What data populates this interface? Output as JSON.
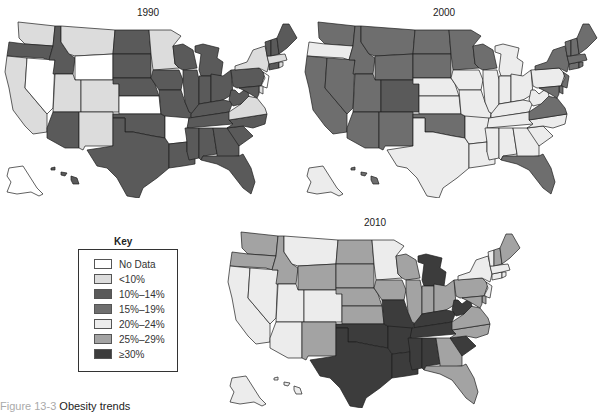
{
  "figure": {
    "caption_label": "Figure 13-3",
    "caption_title": "Obesity trends"
  },
  "key": {
    "title": "Key",
    "categories": [
      {
        "id": "nd",
        "label": "No Data",
        "color": "#ffffff"
      },
      {
        "id": "lt10",
        "label": "<10%",
        "color": "#dcdcdc"
      },
      {
        "id": "c10",
        "label": "10%–14%",
        "color": "#5a5a5a"
      },
      {
        "id": "c15",
        "label": "15%–19%",
        "color": "#6e6e6e"
      },
      {
        "id": "c20",
        "label": "20%–24%",
        "color": "#ececec"
      },
      {
        "id": "c25",
        "label": "25%–29%",
        "color": "#a3a3a3"
      },
      {
        "id": "c30",
        "label": "≥30%",
        "color": "#3c3c3c"
      }
    ]
  },
  "chart_data": [
    {
      "type": "choropleth",
      "title": "1990",
      "legend_position": "separate key box, lower left",
      "values": {
        "WA": "lt10",
        "OR": "c10",
        "CA": "lt10",
        "NV": "nd",
        "ID": "c10",
        "MT": "lt10",
        "WY": "nd",
        "UT": "lt10",
        "CO": "lt10",
        "AZ": "c10",
        "NM": "lt10",
        "ND": "c10",
        "SD": "c10",
        "NE": "c10",
        "KS": "nd",
        "OK": "c10",
        "TX": "c10",
        "MN": "lt10",
        "IA": "c10",
        "MO": "c10",
        "AR": "nd",
        "LA": "c10",
        "WI": "c10",
        "IL": "c10",
        "MI": "c10",
        "IN": "c10",
        "OH": "c10",
        "KY": "c10",
        "TN": "c10",
        "MS": "c10",
        "AL": "c10",
        "GA": "c10",
        "FL": "c10",
        "SC": "c10",
        "NC": "c10",
        "VA": "lt10",
        "WV": "c10",
        "PA": "c10",
        "NY": "lt10",
        "NJ": "nd",
        "DE": "lt10",
        "MD": "c10",
        "CT": "c10",
        "RI": "lt10",
        "MA": "lt10",
        "VT": "c10",
        "NH": "c10",
        "ME": "c10",
        "AK": "nd",
        "HI": "c10"
      }
    },
    {
      "type": "choropleth",
      "title": "2000",
      "values": {
        "WA": "c15",
        "OR": "c20",
        "CA": "c15",
        "NV": "c15",
        "ID": "c15",
        "MT": "c15",
        "WY": "c15",
        "UT": "c15",
        "CO": "c10",
        "AZ": "c15",
        "NM": "c15",
        "ND": "c15",
        "SD": "c15",
        "NE": "c20",
        "KS": "c20",
        "OK": "c15",
        "TX": "c20",
        "MN": "c15",
        "IA": "c20",
        "MO": "c20",
        "AR": "c20",
        "LA": "c20",
        "WI": "c15",
        "IL": "c20",
        "MI": "c20",
        "IN": "c20",
        "OH": "c20",
        "KY": "c20",
        "TN": "c20",
        "MS": "c20",
        "AL": "c20",
        "GA": "c20",
        "FL": "c15",
        "SC": "c20",
        "NC": "c20",
        "VA": "c15",
        "WV": "c20",
        "PA": "c20",
        "NY": "c15",
        "NJ": "c15",
        "DE": "c15",
        "MD": "c15",
        "CT": "c15",
        "RI": "c15",
        "MA": "c15",
        "VT": "c15",
        "NH": "c15",
        "ME": "c15",
        "AK": "c20",
        "HI": "c15"
      }
    },
    {
      "type": "choropleth",
      "title": "2010",
      "values": {
        "WA": "c25",
        "OR": "c25",
        "CA": "c20",
        "NV": "c20",
        "ID": "c25",
        "MT": "c20",
        "WY": "c25",
        "UT": "c20",
        "CO": "c20",
        "AZ": "c20",
        "NM": "c25",
        "ND": "c25",
        "SD": "c25",
        "NE": "c25",
        "KS": "c25",
        "OK": "c30",
        "TX": "c30",
        "MN": "c20",
        "IA": "c25",
        "MO": "c30",
        "AR": "c30",
        "LA": "c30",
        "WI": "c25",
        "IL": "c25",
        "MI": "c30",
        "IN": "c25",
        "OH": "c25",
        "KY": "c30",
        "TN": "c30",
        "MS": "c30",
        "AL": "c30",
        "GA": "c25",
        "FL": "c25",
        "SC": "c30",
        "NC": "c25",
        "VA": "c25",
        "WV": "c30",
        "PA": "c25",
        "NY": "c20",
        "NJ": "c20",
        "DE": "c25",
        "MD": "c25",
        "CT": "c20",
        "RI": "c20",
        "MA": "c20",
        "VT": "c20",
        "NH": "c25",
        "ME": "c25",
        "AK": "c20",
        "HI": "c20"
      }
    }
  ]
}
